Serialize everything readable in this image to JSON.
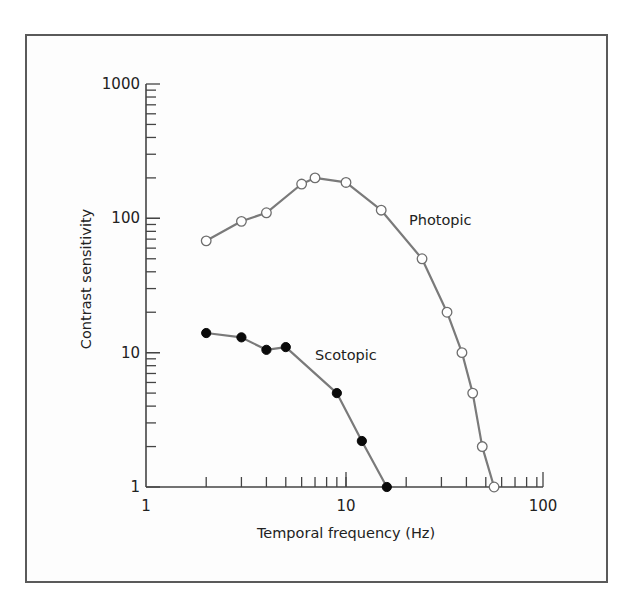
{
  "chart_data": {
    "type": "line",
    "title": "",
    "xlabel": "Temporal frequency (Hz)",
    "ylabel": "Contrast sensitivity",
    "xscale": "log",
    "yscale": "log",
    "xlim": [
      1,
      100
    ],
    "ylim": [
      1,
      1000
    ],
    "x_ticks": [
      1,
      10,
      100
    ],
    "x_tick_labels": [
      "1",
      "10",
      "100"
    ],
    "y_ticks": [
      1,
      10,
      100,
      1000
    ],
    "y_tick_labels": [
      "1",
      "10",
      "100",
      "1000"
    ],
    "grid": false,
    "legend": "none (series labeled inline)",
    "series": [
      {
        "name": "Photopic",
        "marker": "open-circle",
        "color": "#7a7a7a",
        "x": [
          2,
          3,
          4,
          6,
          7,
          10,
          15,
          24,
          32,
          38,
          43,
          48,
          55
        ],
        "y": [
          68,
          95,
          110,
          180,
          200,
          185,
          115,
          50,
          20,
          10,
          5,
          2,
          1
        ]
      },
      {
        "name": "Scotopic",
        "marker": "filled-circle",
        "color": "#0a0a0a",
        "x": [
          2,
          3,
          4,
          5,
          9,
          12,
          16
        ],
        "y": [
          14,
          13,
          10.5,
          11,
          5,
          2.2,
          1
        ]
      }
    ],
    "annotations": [
      {
        "text": "Photopic",
        "near_x": 24,
        "near_y": 100
      },
      {
        "text": "Scotopic",
        "near_x": 9,
        "near_y": 10
      }
    ]
  }
}
